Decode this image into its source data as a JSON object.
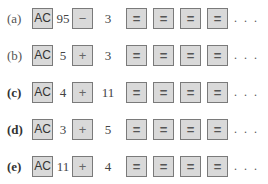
{
  "problems": [
    {
      "label": "(a)",
      "bold": false,
      "clear": "AC",
      "first": "95",
      "op": "−",
      "second": "3",
      "equals": [
        "=",
        "=",
        "=",
        "="
      ],
      "ellipsis": ". . ."
    },
    {
      "label": "(b)",
      "bold": false,
      "clear": "AC",
      "first": "5",
      "op": "+",
      "second": "3",
      "equals": [
        "=",
        "=",
        "=",
        "="
      ],
      "ellipsis": ". . ."
    },
    {
      "label": "(c)",
      "bold": true,
      "clear": "AC",
      "first": "4",
      "op": "+",
      "second": "11",
      "equals": [
        "=",
        "=",
        "=",
        "="
      ],
      "ellipsis": ". . ."
    },
    {
      "label": "(d)",
      "bold": true,
      "clear": "AC",
      "first": "3",
      "op": "+",
      "second": "5",
      "equals": [
        "=",
        "=",
        "=",
        "="
      ],
      "ellipsis": ". . ."
    },
    {
      "label": "(e)",
      "bold": true,
      "clear": "AC",
      "first": "11",
      "op": "+",
      "second": "4",
      "equals": [
        "=",
        "=",
        "=",
        "="
      ],
      "ellipsis": ". . ."
    }
  ]
}
